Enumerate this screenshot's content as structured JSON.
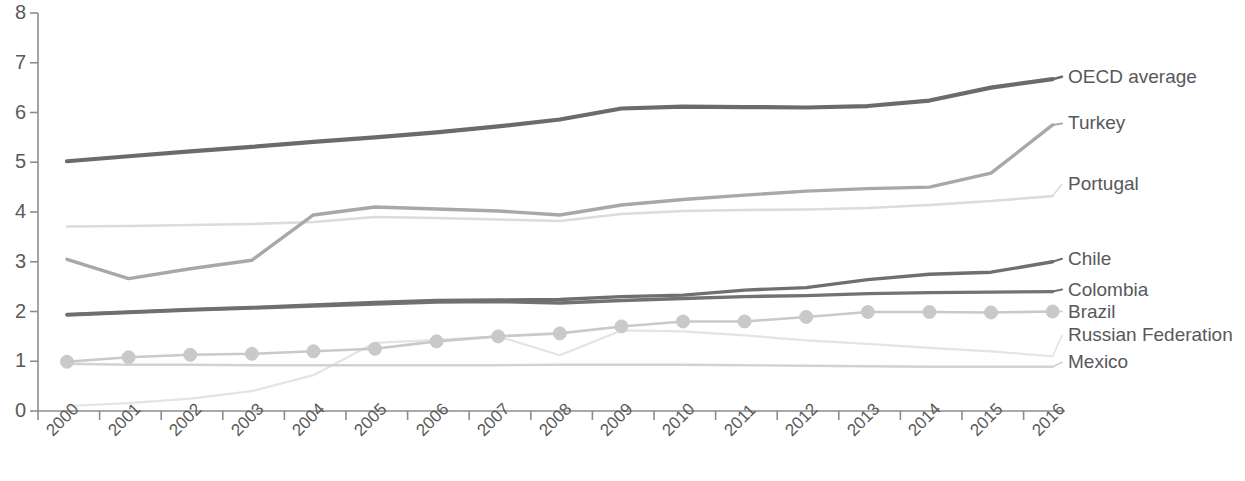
{
  "chart_data": {
    "type": "line",
    "title": "",
    "xlabel": "",
    "ylabel": "",
    "xlim": [
      2000,
      2016
    ],
    "ylim": [
      0,
      8
    ],
    "yticks": [
      "0",
      "1",
      "2",
      "3",
      "4",
      "5",
      "6",
      "7",
      "8"
    ],
    "grid": false,
    "legend_position": "right-inline-labels",
    "categories": [
      "2000",
      "2001",
      "2002",
      "2003",
      "2004",
      "2005",
      "2006",
      "2007",
      "2008",
      "2009",
      "2010",
      "2011",
      "2012",
      "2013",
      "2014",
      "2015",
      "2016"
    ],
    "series": [
      {
        "name": "OECD average",
        "color": "#6b6b6b",
        "width": 4.2,
        "marker": "none",
        "label_y_value": 6.72,
        "values": [
          5.02,
          5.12,
          5.22,
          5.31,
          5.41,
          5.5,
          5.6,
          5.72,
          5.86,
          6.08,
          6.12,
          6.11,
          6.1,
          6.13,
          6.24,
          6.5,
          6.67
        ]
      },
      {
        "name": "Turkey",
        "color": "#a8a8a8",
        "width": 3.4,
        "marker": "none",
        "label_y_value": 5.78,
        "values": [
          3.05,
          2.66,
          2.86,
          3.03,
          3.94,
          4.1,
          4.06,
          4.02,
          3.94,
          4.14,
          4.25,
          4.34,
          4.42,
          4.47,
          4.5,
          4.78,
          5.75
        ]
      },
      {
        "name": "Portugal",
        "color": "#dcdcdc",
        "width": 2.6,
        "marker": "none",
        "label_y_value": 4.56,
        "values": [
          3.71,
          3.72,
          3.74,
          3.76,
          3.8,
          3.9,
          3.88,
          3.85,
          3.82,
          3.96,
          4.02,
          4.04,
          4.05,
          4.08,
          4.14,
          4.22,
          4.32
        ]
      },
      {
        "name": "Chile",
        "color": "#6f6f6f",
        "width": 3.4,
        "marker": "none",
        "label_y_value": 3.06,
        "values": [
          1.94,
          1.99,
          2.04,
          2.08,
          2.13,
          2.18,
          2.22,
          2.23,
          2.24,
          2.3,
          2.33,
          2.43,
          2.48,
          2.64,
          2.75,
          2.79,
          3.0
        ]
      },
      {
        "name": "Colombia",
        "color": "#727272",
        "width": 3.4,
        "marker": "none",
        "label_y_value": 2.44,
        "values": [
          1.93,
          1.98,
          2.03,
          2.07,
          2.11,
          2.15,
          2.19,
          2.2,
          2.17,
          2.22,
          2.26,
          2.3,
          2.32,
          2.36,
          2.38,
          2.39,
          2.4
        ]
      },
      {
        "name": "Brazil",
        "color": "#c9c9c9",
        "width": 2.6,
        "marker": "circle",
        "label_y_value": 2.0,
        "values": [
          0.99,
          1.08,
          1.13,
          1.15,
          1.2,
          1.25,
          1.4,
          1.5,
          1.56,
          1.7,
          1.8,
          1.8,
          1.89,
          1.99,
          1.99,
          1.98,
          2.0
        ]
      },
      {
        "name": "Russian Federation",
        "color": "#e4e4e4",
        "width": 2.2,
        "marker": "none",
        "label_y_value": 1.52,
        "values": [
          0.1,
          0.16,
          0.25,
          0.4,
          0.72,
          1.37,
          1.43,
          1.5,
          1.12,
          1.62,
          1.6,
          1.52,
          1.42,
          1.35,
          1.27,
          1.2,
          1.1
        ]
      },
      {
        "name": "Mexico",
        "color": "#d2d2d2",
        "width": 2.4,
        "marker": "none",
        "label_y_value": 0.98,
        "values": [
          0.95,
          0.93,
          0.93,
          0.92,
          0.92,
          0.92,
          0.92,
          0.92,
          0.93,
          0.93,
          0.93,
          0.92,
          0.91,
          0.9,
          0.89,
          0.89,
          0.89
        ]
      }
    ]
  },
  "axis": {
    "color": "#8c8c8c",
    "tick_color": "#8c8c8c"
  }
}
